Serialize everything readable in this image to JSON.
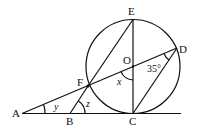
{
  "diagram": {
    "type": "geometry",
    "points": {
      "A": "A",
      "B": "B",
      "C": "C",
      "D": "D",
      "E": "E",
      "F": "F",
      "O": "O"
    },
    "angles": {
      "x": "x",
      "y": "y",
      "z": "z",
      "given": "35°"
    },
    "colors": {
      "stroke": "#111111",
      "background": "#ffffff"
    }
  }
}
